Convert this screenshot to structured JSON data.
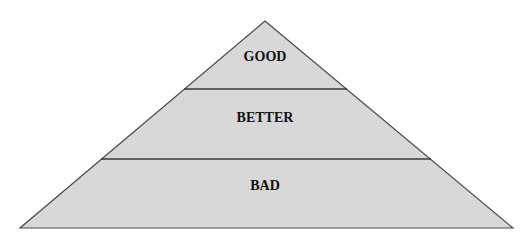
{
  "diagram": {
    "type": "pyramid",
    "colors": {
      "fill": "#d8d8d8",
      "stroke": "#4a4a4a",
      "text": "#111111",
      "background": "#ffffff"
    },
    "levels": [
      {
        "position": "top",
        "label": "GOOD"
      },
      {
        "position": "middle",
        "label": "BETTER"
      },
      {
        "position": "bottom",
        "label": "BAD"
      }
    ]
  }
}
